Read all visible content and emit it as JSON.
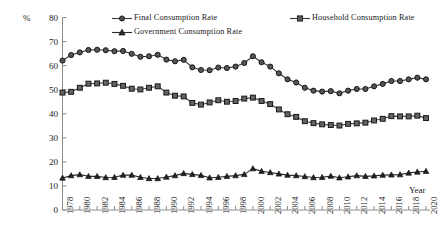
{
  "axis": {
    "y_unit_label": "%",
    "x_axis_label": "Year",
    "y_ticks": [
      "0",
      "10",
      "20",
      "30",
      "40",
      "50",
      "60",
      "70",
      "80"
    ],
    "x_ticks": [
      "1978",
      "1980",
      "1982",
      "1984",
      "1986",
      "1988",
      "1990",
      "1992",
      "1994",
      "1996",
      "1998",
      "2000",
      "2002",
      "2004",
      "2006",
      "2008",
      "2010",
      "2012",
      "2014",
      "2016",
      "2018",
      "2020"
    ]
  },
  "legend": {
    "entries": [
      {
        "label": "Final Consumption  Rate",
        "marker": "circle-marker",
        "color": "#3a3a3a"
      },
      {
        "label": "Household Consumption Rate",
        "marker": "square-marker",
        "color": "#3a3a3a"
      },
      {
        "label": "Government Consumption Rate",
        "marker": "triangle-marker",
        "color": "#2a2a2a"
      }
    ]
  },
  "chart_data": {
    "type": "line",
    "title": "",
    "xlabel": "Year",
    "ylabel": "%",
    "xlim": [
      1978,
      2020
    ],
    "ylim": [
      0,
      80
    ],
    "ytick_interval": 10,
    "xtick_interval": 2,
    "grid": false,
    "legend_position": "top",
    "x": [
      1978,
      1979,
      1980,
      1981,
      1982,
      1983,
      1984,
      1985,
      1986,
      1987,
      1988,
      1989,
      1990,
      1991,
      1992,
      1993,
      1994,
      1995,
      1996,
      1997,
      1998,
      1999,
      2000,
      2001,
      2002,
      2003,
      2004,
      2005,
      2006,
      2007,
      2008,
      2009,
      2010,
      2011,
      2012,
      2013,
      2014,
      2015,
      2016,
      2017,
      2018,
      2019,
      2020
    ],
    "series": [
      {
        "name": "Final Consumption  Rate",
        "marker": "circle-marker",
        "color": "#3a3a3a",
        "values": [
          62.1,
          64.4,
          65.5,
          66.5,
          66.6,
          66.4,
          66.0,
          66.1,
          64.9,
          63.7,
          63.9,
          64.5,
          62.5,
          61.8,
          62.4,
          59.3,
          58.2,
          58.1,
          59.2,
          59.0,
          59.6,
          61.1,
          63.9,
          61.4,
          59.6,
          56.8,
          54.3,
          53.0,
          50.8,
          49.6,
          49.2,
          49.4,
          48.5,
          49.6,
          50.3,
          50.3,
          51.4,
          52.4,
          53.6,
          53.6,
          54.3,
          55.0,
          54.3
        ]
      },
      {
        "name": "Household Consumption Rate",
        "marker": "square-marker",
        "color": "#4a4a4a",
        "values": [
          48.8,
          49.1,
          50.8,
          52.5,
          52.6,
          52.9,
          52.4,
          51.6,
          50.4,
          50.1,
          50.8,
          51.4,
          48.8,
          47.5,
          47.2,
          44.5,
          43.8,
          44.7,
          45.6,
          45.0,
          45.3,
          46.3,
          46.7,
          45.3,
          44.0,
          41.8,
          39.8,
          38.7,
          36.9,
          36.1,
          35.6,
          35.3,
          35.1,
          35.8,
          36.0,
          36.3,
          37.2,
          37.9,
          39.0,
          38.9,
          38.9,
          39.2,
          38.2
        ]
      },
      {
        "name": "Government Consumption Rate",
        "marker": "triangle-marker",
        "color": "#2a2a2a",
        "values": [
          13.3,
          14.3,
          14.7,
          14.0,
          14.0,
          13.5,
          13.6,
          14.5,
          14.5,
          13.6,
          13.1,
          13.1,
          13.7,
          14.3,
          15.2,
          14.8,
          14.4,
          13.4,
          13.6,
          14.0,
          14.3,
          14.8,
          17.2,
          16.1,
          15.6,
          15.0,
          14.5,
          14.3,
          13.9,
          13.5,
          13.6,
          14.1,
          13.4,
          13.8,
          14.3,
          14.0,
          14.2,
          14.5,
          14.6,
          14.7,
          15.4,
          15.8,
          16.1
        ]
      }
    ]
  }
}
